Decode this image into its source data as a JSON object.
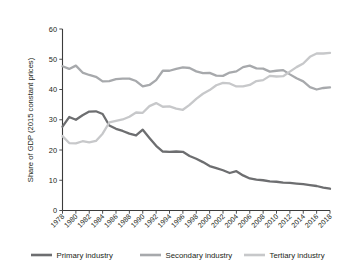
{
  "chart_data": {
    "type": "line",
    "title": "",
    "xlabel": "",
    "ylabel": "Share of GDP (2015 constant prices)",
    "xlim": [
      1978,
      2018
    ],
    "ylim": [
      0,
      60
    ],
    "ytick_values": [
      0,
      10,
      20,
      30,
      40,
      50,
      60
    ],
    "ytick_labels": [
      "0",
      "10",
      "20",
      "30",
      "40",
      "50",
      "60"
    ],
    "xtick_values": [
      1978,
      1980,
      1982,
      1984,
      1986,
      1988,
      1990,
      1992,
      1994,
      1996,
      1998,
      2000,
      2002,
      2004,
      2006,
      2008,
      2010,
      2012,
      2014,
      2016,
      2018
    ],
    "xtick_labels": [
      "1978",
      "1980",
      "1982",
      "1984",
      "1986",
      "1988",
      "1990",
      "1992",
      "1994",
      "1996",
      "1998",
      "2000",
      "2002",
      "2004",
      "2006",
      "2008",
      "2010",
      "2012",
      "2014",
      "2016",
      "2018"
    ],
    "grid": false,
    "legend_position": "bottom",
    "x": [
      1978,
      1979,
      1980,
      1981,
      1982,
      1983,
      1984,
      1985,
      1986,
      1987,
      1988,
      1989,
      1990,
      1991,
      1992,
      1993,
      1994,
      1995,
      1996,
      1997,
      1998,
      1999,
      2000,
      2001,
      2002,
      2003,
      2004,
      2005,
      2006,
      2007,
      2008,
      2009,
      2010,
      2011,
      2012,
      2013,
      2014,
      2015,
      2016,
      2017,
      2018
    ],
    "series": [
      {
        "name": "Primary industry",
        "color": "#6d6e70",
        "values": [
          27.7,
          30.9,
          30.0,
          31.5,
          32.7,
          32.8,
          31.9,
          28.1,
          27.0,
          26.3,
          25.4,
          24.8,
          26.7,
          24.0,
          21.4,
          19.5,
          19.4,
          19.5,
          19.4,
          18.0,
          17.1,
          16.0,
          14.7,
          14.0,
          13.3,
          12.4,
          13.0,
          11.6,
          10.6,
          10.2,
          10.0,
          9.6,
          9.5,
          9.2,
          9.1,
          8.9,
          8.7,
          8.4,
          8.1,
          7.6,
          7.2
        ]
      },
      {
        "name": "Secondary industry",
        "color": "#a7a9ac",
        "values": [
          47.7,
          46.8,
          47.9,
          45.6,
          44.8,
          44.2,
          42.7,
          42.8,
          43.4,
          43.6,
          43.6,
          42.8,
          41.0,
          41.5,
          43.1,
          46.2,
          46.2,
          46.8,
          47.3,
          47.1,
          46.0,
          45.4,
          45.5,
          44.6,
          44.5,
          45.6,
          46.0,
          47.4,
          47.9,
          47.0,
          46.9,
          45.9,
          46.2,
          46.4,
          45.0,
          43.7,
          42.7,
          40.8,
          40.0,
          40.5,
          40.7
        ]
      },
      {
        "name": "Tertiary industry",
        "color": "#c7c8ca",
        "values": [
          24.6,
          22.3,
          22.2,
          22.9,
          22.5,
          23.0,
          25.4,
          29.1,
          29.6,
          30.1,
          31.0,
          32.4,
          32.3,
          34.5,
          35.5,
          34.3,
          34.4,
          33.7,
          33.3,
          34.9,
          36.9,
          38.6,
          39.8,
          41.4,
          42.2,
          42.0,
          41.0,
          41.0,
          41.5,
          42.8,
          43.1,
          44.5,
          44.3,
          44.4,
          45.9,
          47.4,
          48.6,
          50.8,
          51.9,
          51.9,
          52.1
        ]
      }
    ],
    "legend": [
      {
        "label": "Primary industry",
        "color": "#6d6e70"
      },
      {
        "label": "Secondary industry",
        "color": "#a7a9ac"
      },
      {
        "label": "Tertiary industry",
        "color": "#c7c8ca"
      }
    ]
  }
}
